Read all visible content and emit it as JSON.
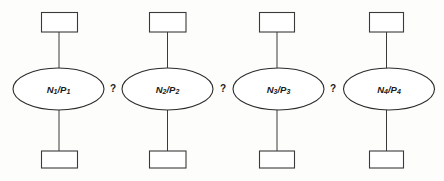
{
  "diagram": {
    "type": "process-chain-diagram",
    "background_color": "#fdfdfc",
    "stroke_color": "#2b2b2b",
    "fill_color": "#ffffff",
    "stages": [
      {
        "id": "stage-1",
        "ellipse_label": "N1/P1",
        "ellipse_label_base": "N",
        "ellipse_label_sub1": "1",
        "ellipse_label_mid": "/P",
        "ellipse_label_sub2": "1",
        "top_box_label": "",
        "bottom_box_label": ""
      },
      {
        "id": "stage-2",
        "ellipse_label": "N2/P2",
        "ellipse_label_base": "N",
        "ellipse_label_sub1": "2",
        "ellipse_label_mid": "/P",
        "ellipse_label_sub2": "2",
        "top_box_label": "",
        "bottom_box_label": ""
      },
      {
        "id": "stage-3",
        "ellipse_label": "N3/P3",
        "ellipse_label_base": "N",
        "ellipse_label_sub1": "3",
        "ellipse_label_mid": "/P",
        "ellipse_label_sub2": "3",
        "top_box_label": "",
        "bottom_box_label": ""
      },
      {
        "id": "stage-4",
        "ellipse_label": "N4/P4",
        "ellipse_label_base": "N",
        "ellipse_label_sub1": "4",
        "ellipse_label_mid": "/P",
        "ellipse_label_sub2": "4",
        "top_box_label": "",
        "bottom_box_label": ""
      }
    ],
    "separators": [
      {
        "id": "separator-1",
        "label": "?"
      },
      {
        "id": "separator-2",
        "label": "?"
      },
      {
        "id": "separator-3",
        "label": "?"
      }
    ]
  }
}
